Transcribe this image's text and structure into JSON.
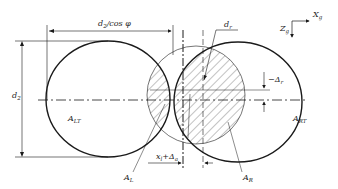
{
  "diagram": {
    "type": "engineering-geometry",
    "colors": {
      "stroke": "#1a1a1a",
      "hatch": "#333333",
      "background": "#ffffff"
    },
    "labels": {
      "top_dimension": {
        "main": "d",
        "sub": "2",
        "rest": "/cos φ"
      },
      "left_dimension": {
        "main": "d",
        "sub": "2"
      },
      "circle_diameter": {
        "main": "d",
        "sub": "r"
      },
      "axis_x": {
        "main": "X",
        "sub": "g"
      },
      "axis_z": {
        "main": "Z",
        "sub": "g"
      },
      "offset_vertical": {
        "main": "−Δ",
        "sub": "r"
      },
      "offset_horizontal": {
        "main": "x",
        "sub": "l",
        "rest": "+Δ",
        "sub2": "a"
      },
      "left_ellipse_area": {
        "main": "A",
        "sub": "LT"
      },
      "right_ellipse_area": {
        "main": "A",
        "sub": "RT"
      },
      "left_hatched_area": {
        "main": "A",
        "sub": "L"
      },
      "right_hatched_area": {
        "main": "A",
        "sub": "R"
      }
    }
  }
}
